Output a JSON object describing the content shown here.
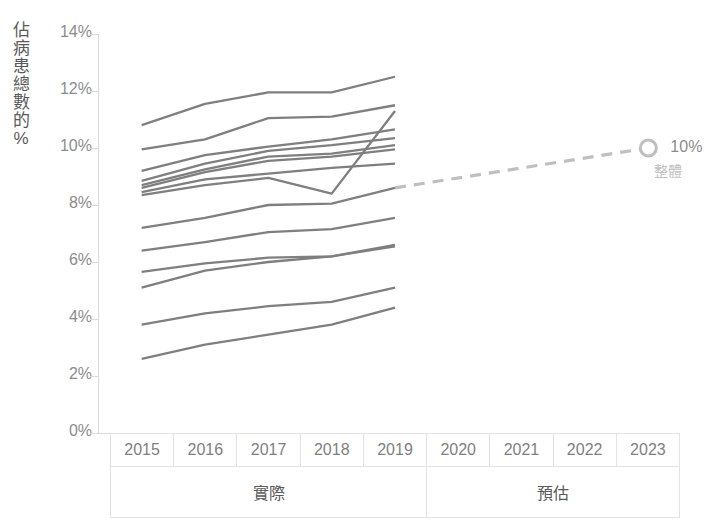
{
  "chart_data": {
    "type": "line",
    "title": "",
    "subtitle": "",
    "xlabel": "",
    "ylabel": "佔病患總數的%",
    "x": [
      2015,
      2016,
      2017,
      2018,
      2019,
      2020,
      2021,
      2022,
      2023
    ],
    "ylim": [
      0,
      14
    ],
    "ytick_labels": [
      "0%",
      "2%",
      "4%",
      "6%",
      "8%",
      "10%",
      "12%",
      "14%"
    ],
    "ytick_values": [
      0,
      2,
      4,
      6,
      8,
      10,
      12,
      14
    ],
    "xtick_labels": [
      "2015",
      "2016",
      "2017",
      "2018",
      "2019",
      "2020",
      "2021",
      "2022",
      "2023"
    ],
    "grid": false,
    "legend_position": "none",
    "x_group_labels": [
      {
        "label": "實際",
        "span": [
          "2015",
          "2019"
        ]
      },
      {
        "label": "預估",
        "span": [
          "2020",
          "2023"
        ]
      }
    ],
    "annotations": [
      {
        "label": "10%",
        "sublabel": "整體",
        "x": 2023,
        "y": 10,
        "marker": "open-circle"
      }
    ],
    "series": [
      {
        "name": "line-1",
        "style": "solid",
        "x": [
          2015,
          2016,
          2017,
          2018,
          2019
        ],
        "values": [
          10.8,
          11.55,
          11.95,
          11.95,
          12.5
        ]
      },
      {
        "name": "line-2",
        "style": "solid",
        "x": [
          2015,
          2016,
          2017,
          2018,
          2019
        ],
        "values": [
          9.95,
          10.3,
          11.05,
          11.1,
          11.5
        ]
      },
      {
        "name": "line-3",
        "style": "solid",
        "x": [
          2015,
          2016,
          2017,
          2018,
          2019
        ],
        "values": [
          9.2,
          9.75,
          10.05,
          10.3,
          10.65
        ]
      },
      {
        "name": "line-4",
        "style": "solid",
        "x": [
          2015,
          2016,
          2017,
          2018,
          2019
        ],
        "values": [
          8.85,
          9.45,
          9.9,
          10.1,
          10.35
        ]
      },
      {
        "name": "line-5",
        "style": "solid",
        "x": [
          2015,
          2016,
          2017,
          2018,
          2019
        ],
        "values": [
          8.7,
          9.25,
          9.7,
          9.8,
          10.1
        ]
      },
      {
        "name": "line-6",
        "style": "solid",
        "x": [
          2015,
          2016,
          2017,
          2018,
          2019
        ],
        "values": [
          8.6,
          9.15,
          9.55,
          9.7,
          9.95
        ]
      },
      {
        "name": "line-7",
        "style": "solid",
        "x": [
          2015,
          2016,
          2017,
          2018,
          2019
        ],
        "values": [
          8.45,
          8.9,
          9.1,
          9.3,
          9.45
        ]
      },
      {
        "name": "line-8",
        "style": "solid",
        "x": [
          2015,
          2016,
          2017,
          2018,
          2019
        ],
        "values": [
          8.35,
          8.7,
          8.95,
          8.4,
          11.3
        ]
      },
      {
        "name": "line-9",
        "style": "solid",
        "x": [
          2015,
          2016,
          2017,
          2018,
          2019
        ],
        "values": [
          7.2,
          7.55,
          8.0,
          8.05,
          8.6
        ]
      },
      {
        "name": "line-10",
        "style": "solid",
        "x": [
          2015,
          2016,
          2017,
          2018,
          2019
        ],
        "values": [
          6.4,
          6.7,
          7.05,
          7.15,
          7.55
        ]
      },
      {
        "name": "line-11",
        "style": "solid",
        "x": [
          2015,
          2016,
          2017,
          2018,
          2019
        ],
        "values": [
          5.65,
          5.95,
          6.15,
          6.2,
          6.6
        ]
      },
      {
        "name": "line-12",
        "style": "solid",
        "x": [
          2015,
          2016,
          2017,
          2018,
          2019
        ],
        "values": [
          5.1,
          5.7,
          6.0,
          6.2,
          6.55
        ]
      },
      {
        "name": "line-13",
        "style": "solid",
        "x": [
          2015,
          2016,
          2017,
          2018,
          2019
        ],
        "values": [
          3.8,
          4.2,
          4.45,
          4.6,
          5.1
        ]
      },
      {
        "name": "line-14",
        "style": "solid",
        "x": [
          2015,
          2016,
          2017,
          2018,
          2019
        ],
        "values": [
          2.6,
          3.1,
          3.45,
          3.8,
          4.4
        ]
      },
      {
        "name": "forecast-overall",
        "style": "dashed",
        "x": [
          2019,
          2023
        ],
        "values": [
          8.6,
          10.0
        ]
      }
    ],
    "colors": {
      "line": "#7f7f7f",
      "forecast_line": "#bfbfbf",
      "axis": "#d9d9d9",
      "tick_label": "#8c8c8c",
      "axis_title": "#595959",
      "grid_border": "#e3e3e3",
      "annotation_value": "#8c8c8c",
      "annotation_label": "#bfbfbf"
    }
  },
  "axis": {
    "y_title_chars": [
      "佔",
      "病",
      "患",
      "總",
      "數",
      "的",
      "%"
    ]
  }
}
